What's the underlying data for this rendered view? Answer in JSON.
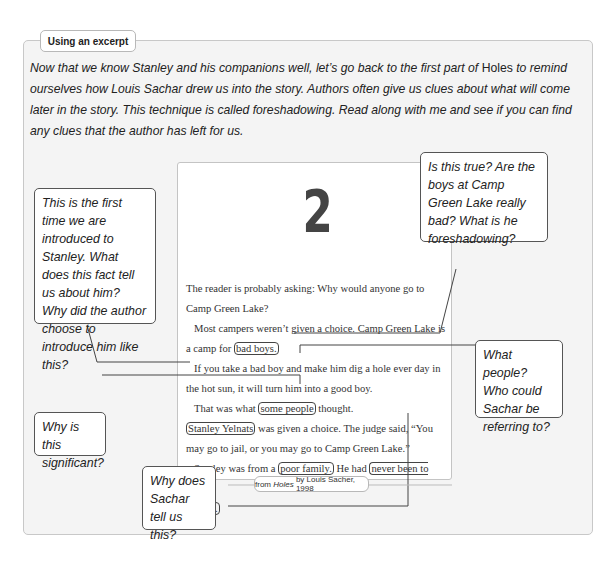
{
  "section": {
    "label": "Using an excerpt"
  },
  "intro": {
    "part1": "Now that we know Stanley and his companions well, let’s go back to the first part of ",
    "book_title": "Holes",
    "part2": " to remind ourselves how Louis Sachar drew us into the story. Authors often give us clues about what will come later in the story. This technique is called foreshadowing. Read along with me and see if you can find any clues that the author has left for us."
  },
  "excerpt": {
    "chapter_number": "2",
    "lines": {
      "p1": "The reader is probably asking: Why would anyone go to Camp Green Lake?",
      "p2_before": "Most campers weren’t given a choice. Camp Green Lake is a camp for ",
      "p2_highlight": "bad boys.",
      "p3": "If you take a bad boy and make him dig a hole ever day in the hot sun, it will turn him into a good boy.",
      "p4_before": "That was what ",
      "p4_highlight": "some people",
      "p4_after": " thought.",
      "p5_highlight": "Stanley Yelnats",
      "p5_after": " was given a choice. The judge said, “You may go to jail, or you may go to Camp Green Lake.”",
      "p6_before": "Stanley was from a ",
      "p6_highlight1": "poor family.",
      "p6_middle": " He had ",
      "p6_highlight2": "never been to camp",
      "p7_highlight": "before."
    },
    "source": {
      "prefix": "from ",
      "title": "Holes",
      "suffix": " by Louis Sacher, 1998"
    }
  },
  "callouts": {
    "first_time": "This is the first time we are introduced to Stanley. What does this fact tell us about him? Why did the author choose to introduce him like this?",
    "is_this_true": "Is this true? Are the boys at Camp Green Lake really bad? What is he foreshadowing?",
    "what_people": "What people? Who could Sachar be referring to?",
    "why_significant": "Why is this significant?",
    "why_tell": "Why does Sachar tell us this?"
  },
  "colors": {
    "panel_bg": "#f4f4f4",
    "border": "#555555",
    "text": "#222222"
  }
}
